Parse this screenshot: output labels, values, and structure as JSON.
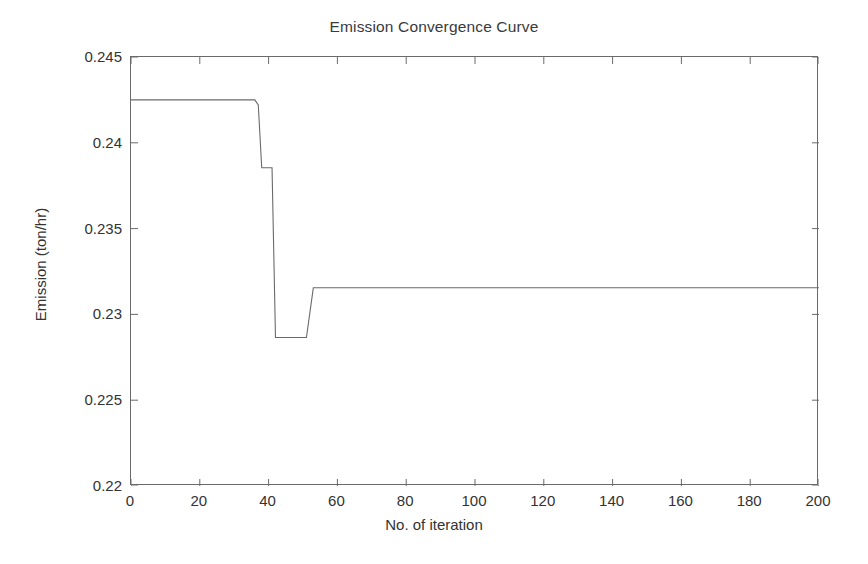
{
  "chart_data": {
    "type": "line",
    "title": "Emission Convergence Curve",
    "xlabel": "No. of iteration",
    "ylabel": "Emission (ton/hr)",
    "xlim": [
      0,
      200
    ],
    "ylim": [
      0.22,
      0.245
    ],
    "grid": false,
    "legend": null,
    "xticks": [
      0,
      20,
      40,
      60,
      80,
      100,
      120,
      140,
      160,
      180,
      200
    ],
    "xtick_labels": [
      "0",
      "20",
      "40",
      "60",
      "80",
      "100",
      "120",
      "140",
      "160",
      "180",
      "200"
    ],
    "yticks": [
      0.22,
      0.225,
      0.23,
      0.235,
      0.24,
      0.245
    ],
    "ytick_labels": [
      "0.22",
      "0.225",
      "0.23",
      "0.235",
      "0.24",
      "0.245"
    ],
    "line_color": "#6a6a6a",
    "line_width": 1,
    "series": [
      {
        "name": "Emission",
        "x": [
          0,
          36,
          37,
          38,
          41,
          42,
          51,
          53,
          200
        ],
        "y": [
          0.2425,
          0.2425,
          0.2422,
          0.23855,
          0.23855,
          0.22865,
          0.22865,
          0.23155,
          0.23155
        ]
      }
    ],
    "step_plateaus": [
      {
        "from_iteration": 0,
        "to_iteration": 36,
        "value": 0.2425
      },
      {
        "from_iteration": 38,
        "to_iteration": 41,
        "value": 0.23855
      },
      {
        "from_iteration": 42,
        "to_iteration": 51,
        "value": 0.22865
      },
      {
        "from_iteration": 53,
        "to_iteration": 200,
        "value": 0.23155
      }
    ],
    "final_value": 0.2315,
    "initial_value": 0.2425
  }
}
